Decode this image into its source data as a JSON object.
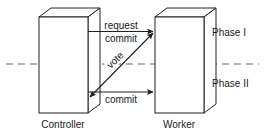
{
  "diagram": {
    "canvas": {
      "width": 265,
      "height": 140,
      "background": "#ffffff"
    },
    "colors": {
      "stroke": "#231f20",
      "box_face": "#ffffff",
      "box_top": "#ffffff",
      "box_side": "#ffffff",
      "divider": "#595959",
      "text": "#1a1a1a"
    },
    "nodes": [
      {
        "id": "controller",
        "label": "Controller",
        "shape": "3d-box",
        "side": "left"
      },
      {
        "id": "worker",
        "label": "Worker",
        "shape": "3d-box",
        "side": "right"
      }
    ],
    "messages": [
      {
        "id": "request",
        "label": "request",
        "from": "controller",
        "to": "worker",
        "direction": "right",
        "arrowheads": "single",
        "phase": "Phase I",
        "position": "above-line"
      },
      {
        "id": "commit-top",
        "label": "commit",
        "from": "controller",
        "to": "worker",
        "direction": "right",
        "arrowheads": "single",
        "phase": "Phase I",
        "position": "below-line"
      },
      {
        "id": "vote",
        "label": "vote",
        "from": "worker",
        "to": "controller",
        "direction": "diagonal",
        "arrowheads": "double",
        "phase": "Phase I / Phase II",
        "rotation_deg": -44
      },
      {
        "id": "commit-bottom",
        "label": "commit",
        "from": "controller",
        "to": "worker",
        "direction": "right",
        "arrowheads": "single",
        "phase": "Phase II",
        "position": "below-line"
      }
    ],
    "phases": [
      {
        "id": "phase-1",
        "label": "Phase I"
      },
      {
        "id": "phase-2",
        "label": "Phase II"
      }
    ],
    "divider": {
      "style": "dashed",
      "orientation": "horizontal",
      "y": 64
    }
  }
}
